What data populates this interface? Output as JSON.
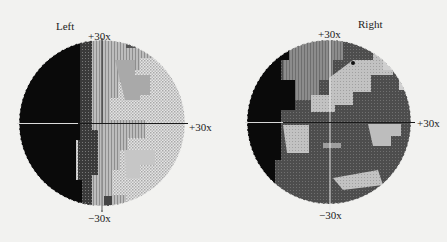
{
  "figure": {
    "panels": [
      {
        "id": "left",
        "title": "Left",
        "axis_labels": {
          "top": "+30x",
          "right": "+30x",
          "bottom": "−30x"
        },
        "center": [
          102,
          123
        ],
        "radius": 83
      },
      {
        "id": "right",
        "title": "Right",
        "axis_labels": {
          "top": "+30x",
          "right": "+30x",
          "bottom": "−30x"
        },
        "center": [
          329,
          122
        ],
        "radius": 82
      }
    ],
    "legend_shades": {
      "black": "#0a0a0a",
      "dark_gray": "#4a4a4a",
      "mid_gray": "#8a8a8a",
      "light_gray": "#b8b8b8",
      "dotted_light": "#d6d6d6",
      "background": "#f2f2f0"
    }
  }
}
